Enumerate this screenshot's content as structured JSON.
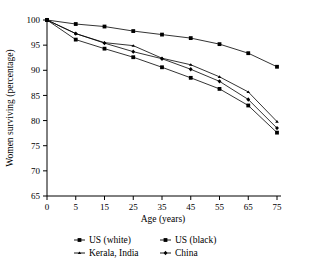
{
  "chart_data": {
    "type": "line",
    "title": "",
    "xlabel": "Age (years)",
    "ylabel": "Women surviving (percentage)",
    "x": [
      0,
      5,
      15,
      25,
      35,
      45,
      55,
      65,
      75
    ],
    "xtick_labels": [
      "0",
      "5",
      "15",
      "25",
      "35",
      "45",
      "55",
      "65",
      "75"
    ],
    "ytick_labels": [
      "65",
      "70",
      "75",
      "80",
      "85",
      "90",
      "95",
      "100"
    ],
    "yticks": [
      65,
      70,
      75,
      80,
      85,
      90,
      95,
      100
    ],
    "ylim": [
      65,
      100
    ],
    "grid": false,
    "legend_position": "below",
    "series": [
      {
        "name": "US (white)",
        "marker": "square",
        "values": [
          100.0,
          99.2,
          98.7,
          97.8,
          97.1,
          96.4,
          95.2,
          93.4,
          90.7
        ]
      },
      {
        "name": "US (black)",
        "marker": "square",
        "values": [
          100.0,
          96.1,
          94.3,
          92.6,
          90.6,
          88.5,
          86.3,
          83.0,
          77.6
        ]
      },
      {
        "name": "Kerala, India",
        "marker": "triangle",
        "values": [
          100.0,
          97.3,
          95.5,
          94.9,
          92.4,
          91.1,
          88.7,
          85.7,
          79.8
        ]
      },
      {
        "name": "China",
        "marker": "diamond",
        "values": [
          100.0,
          97.3,
          95.4,
          93.7,
          92.3,
          90.2,
          87.8,
          84.2,
          78.5
        ]
      }
    ]
  },
  "legend": {
    "entries": [
      {
        "label": "US (white)"
      },
      {
        "label": "US (black)"
      },
      {
        "label": "Kerala, India"
      },
      {
        "label": "China"
      }
    ]
  }
}
